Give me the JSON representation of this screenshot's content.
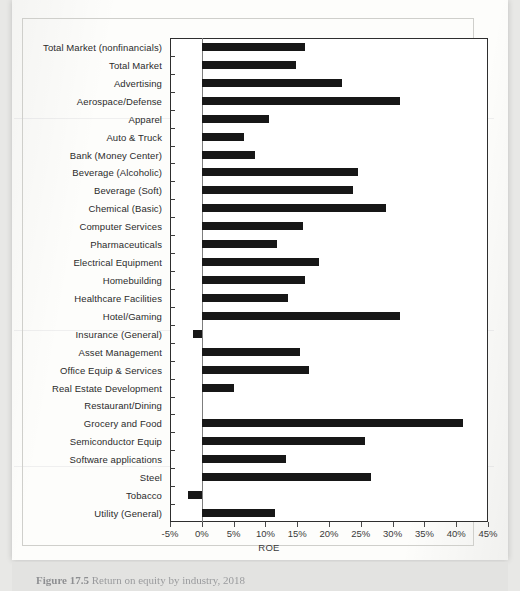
{
  "document": {
    "caption_label": "Figure 17.5",
    "caption_text": "Return on equity by industry, 2018"
  },
  "chart_data": {
    "type": "bar",
    "orientation": "horizontal",
    "title": "",
    "xlabel": "ROE",
    "ylabel": "",
    "xlim": [
      -5,
      45
    ],
    "xticks": [
      "-5%",
      "0%",
      "5%",
      "10%",
      "15%",
      "20%",
      "25%",
      "30%",
      "35%",
      "40%",
      "45%"
    ],
    "xtick_values": [
      -5,
      0,
      5,
      10,
      15,
      20,
      25,
      30,
      35,
      40,
      45
    ],
    "grid": false,
    "legend": "none",
    "units": "percent",
    "categories": [
      "Total Market (nonfinancials)",
      "Total Market",
      "Advertising",
      "Aerospace/Defense",
      "Apparel",
      "Auto & Truck",
      "Bank (Money Center)",
      "Beverage (Alcoholic)",
      "Beverage (Soft)",
      "Chemical (Basic)",
      "Computer Services",
      "Pharmaceuticals",
      "Electrical Equipment",
      "Homebuilding",
      "Healthcare Facilities",
      "Hotel/Gaming",
      "Insurance (General)",
      "Asset Management",
      "Office Equip & Services",
      "Real Estate Development",
      "Restaurant/Dining",
      "Grocery and Food",
      "Semiconductor Equip",
      "Software applications",
      "Steel",
      "Tobacco",
      "Utility (General)"
    ],
    "values": [
      16.3,
      14.8,
      22.0,
      31.2,
      10.6,
      6.6,
      8.3,
      24.6,
      23.8,
      29.0,
      15.9,
      11.8,
      18.4,
      16.3,
      13.6,
      31.2,
      -1.4,
      15.5,
      16.8,
      5.1,
      0.0,
      41.0,
      25.6,
      13.3,
      26.6,
      -2.2,
      11.5
    ]
  }
}
